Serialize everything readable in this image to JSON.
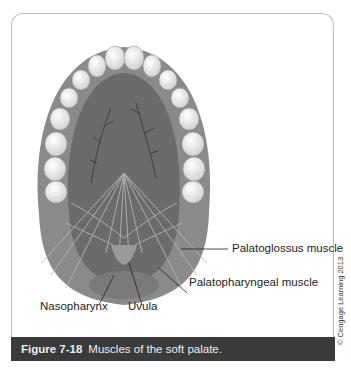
{
  "figure": {
    "number": "Figure 7-18",
    "title": "Muscles of the soft palate.",
    "credit": "© Cengage Learning 2013"
  },
  "labels": {
    "palatoglossus": "Palatoglossus muscle",
    "palatopharyngeal": "Palatopharyngeal muscle",
    "nasopharynx": "Nasopharynx",
    "uvula": "Uvula"
  },
  "colors": {
    "caption_bg": "#3b3b3b",
    "gum": "#8c8c8c",
    "palate": "#6e6e6e",
    "tooth": "#efefef"
  }
}
